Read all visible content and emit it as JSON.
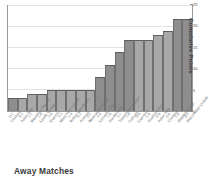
{
  "caption": "Away Matches",
  "colors": {
    "bar_dark": "#8e8e8e",
    "bar_light": "#a8a8a8",
    "bar_edge": "#6f6f6f",
    "grid": "#e2e2e2",
    "frame": "#9a9a9a",
    "text": "#555555"
  },
  "axis": {
    "y_title": "Cumulative Points",
    "y_ticks": [
      "0",
      "5",
      "10",
      "15",
      "20",
      "25"
    ]
  },
  "chart_data": {
    "type": "bar",
    "title": "",
    "subtitle": "",
    "xlabel": "Away Matches",
    "ylabel": "Cumulative Points",
    "ylim": [
      0,
      25
    ],
    "grid": true,
    "legend": false,
    "categories": [
      "Chelsea",
      "Aston Villa",
      "Blackburn Rovers",
      "Leeds United",
      "Everton",
      "West Ham United",
      "Bolton Wanderers",
      "Arsenal",
      "Newcastle United",
      "Leicester City",
      "Sunderland",
      "Tottenham Hotspur",
      "Fulham",
      "Liverpool",
      "Southampton",
      "Aston Villa",
      "Chelsea",
      "Middlesbrough",
      "Manchester United"
    ],
    "scores": [
      "0-1",
      "0-1",
      "1-1",
      "1-0",
      "2-0",
      "2-2",
      "1-0",
      "0-2",
      "0-1",
      "2-0",
      "1-0",
      "2-1",
      "1-0",
      "0-0",
      "1-0",
      "0-0",
      "0-0",
      "1-0",
      "0-1"
    ],
    "values": [
      3,
      3,
      4,
      4,
      5,
      5,
      5,
      5,
      5,
      8,
      11,
      14,
      17,
      17,
      17,
      18,
      19,
      22,
      22
    ],
    "shades": [
      "dark",
      "light",
      "light",
      "light",
      "light",
      "light",
      "light",
      "light",
      "light",
      "dark",
      "dark",
      "dark",
      "dark",
      "light",
      "light",
      "light",
      "light",
      "dark",
      "dark"
    ]
  }
}
